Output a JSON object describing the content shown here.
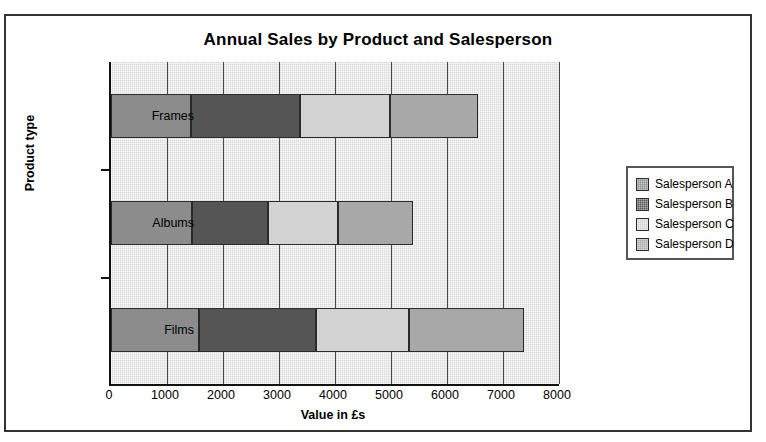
{
  "chart_data": {
    "type": "bar",
    "orientation": "horizontal",
    "stacked": true,
    "title": "Annual Sales by Product and Salesperson",
    "xlabel": "Value in £s",
    "ylabel": "Product type",
    "categories": [
      "Frames",
      "Albums",
      "Films"
    ],
    "series": [
      {
        "name": "Salesperson A",
        "color": "#8c8c8c",
        "values": [
          1420,
          1440,
          1580
        ]
      },
      {
        "name": "Salesperson B",
        "color": "#555555",
        "values": [
          1955,
          1370,
          2080
        ]
      },
      {
        "name": "Salesperson C",
        "color": "#d2d2d2",
        "values": [
          1605,
          1250,
          1670
        ]
      },
      {
        "name": "Salesperson D",
        "color": "#a8a8a8",
        "values": [
          1570,
          1340,
          2045
        ]
      }
    ],
    "cumulative": {
      "Frames": [
        1420,
        3375,
        4980,
        6550
      ],
      "Albums": [
        1440,
        2810,
        4060,
        5400
      ],
      "Films": [
        1580,
        3660,
        5330,
        7375
      ]
    },
    "totals": {
      "Frames": 6550,
      "Albums": 5400,
      "Films": 7375
    },
    "xlim": [
      0,
      8000
    ],
    "xticks": [
      0,
      1000,
      2000,
      3000,
      4000,
      5000,
      6000,
      7000,
      8000
    ],
    "xtick_labels": [
      "0",
      "1000",
      "2000",
      "3000",
      "4000",
      "5000",
      "6000",
      "7000",
      "8000"
    ],
    "grid": "vertical",
    "legend_position": "right",
    "plot_background": "#d8d8d8"
  },
  "legend": {
    "items": [
      {
        "label": "Salesperson A",
        "color": "#8c8c8c",
        "icon": "legend-swatch-icon"
      },
      {
        "label": "Salesperson B",
        "color": "#555555",
        "icon": "legend-swatch-icon"
      },
      {
        "label": "Salesperson C",
        "color": "#d2d2d2",
        "icon": "legend-swatch-icon"
      },
      {
        "label": "Salesperson D",
        "color": "#a8a8a8",
        "icon": "legend-swatch-icon"
      }
    ]
  }
}
